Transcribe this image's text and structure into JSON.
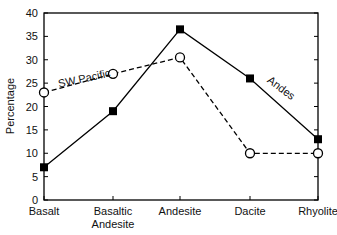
{
  "chart_data": {
    "type": "line",
    "title": "",
    "xlabel": "",
    "ylabel": "Percentage",
    "ylim": [
      0,
      40
    ],
    "yticks": [
      0,
      5,
      10,
      15,
      20,
      25,
      30,
      35,
      40
    ],
    "grid": false,
    "legend": "inline labels on lines",
    "categories": [
      "Basalt",
      "Basaltic Andesite",
      "Andesite",
      "Dacite",
      "Rhyolite"
    ],
    "category_label_lines": [
      [
        "Basalt"
      ],
      [
        "Basaltic",
        "Andesite"
      ],
      [
        "Andesite"
      ],
      [
        "Dacite"
      ],
      [
        "Rhyolite"
      ]
    ],
    "series": [
      {
        "name": "Andes",
        "values": [
          7,
          19,
          36.5,
          26,
          13
        ],
        "line_style": "solid",
        "marker": "filled-square",
        "color": "#000000"
      },
      {
        "name": "SW Pacific",
        "values": [
          23,
          27,
          30.5,
          10,
          10
        ],
        "line_style": "dashed",
        "marker": "open-circle",
        "color": "#000000"
      }
    ],
    "annotations": [
      {
        "text": "SW Pacific",
        "near_series": "SW Pacific",
        "position": "between Basalt and Basaltic Andesite, above line"
      },
      {
        "text": "Andes",
        "near_series": "Andes",
        "position": "between Dacite and Rhyolite, above line"
      }
    ]
  }
}
